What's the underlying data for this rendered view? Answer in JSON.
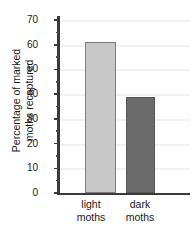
{
  "chart_data": {
    "type": "bar",
    "title": "",
    "xlabel": "",
    "ylabel": "Percentage of marked moths recaptured",
    "ylabel_lines": [
      "Percentage of marked",
      "moths recaptured"
    ],
    "categories": [
      "light moths",
      "dark moths"
    ],
    "category_lines": [
      [
        "light",
        "moths"
      ],
      [
        "dark",
        "moths"
      ]
    ],
    "values": [
      61,
      39
    ],
    "ylim": [
      0,
      70
    ],
    "ytick_major": [
      0,
      10,
      20,
      30,
      40,
      50,
      60,
      70
    ],
    "ytick_minor": [
      5,
      15,
      25,
      35,
      45,
      55,
      65
    ],
    "ytick_labels": [
      "0",
      "10",
      "20",
      "30",
      "40",
      "50",
      "60",
      "70"
    ],
    "grid": true,
    "grid_axis": "y",
    "legend": false,
    "colors": {
      "light_moths": "#c8c8c8",
      "dark_moths": "#6b6b6b",
      "axis": "#3b3b3b",
      "gridline": "#f2f2f2",
      "background": "#ffffff",
      "text": "#1a1a1a"
    }
  }
}
